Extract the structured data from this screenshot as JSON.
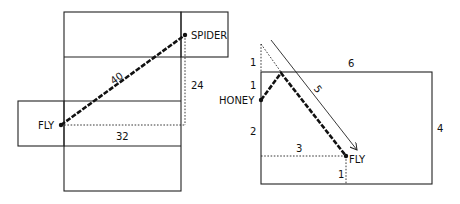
{
  "left_diagram": {
    "labels": {
      "spider": "SPIDER",
      "fly": "FLY",
      "diagonal": "40",
      "vertical": "24",
      "horizontal": "32"
    }
  },
  "right_diagram": {
    "labels": {
      "honey": "HONEY",
      "fly": "FLY",
      "top": "6",
      "right": "4",
      "diagonal": "5",
      "left_upper_outside": "1",
      "left_upper": "1",
      "left_lower": "2",
      "bottom_horizontal": "3",
      "bottom_vertical": "1"
    }
  },
  "colors": {
    "line": "#222222",
    "background": "#ffffff"
  }
}
